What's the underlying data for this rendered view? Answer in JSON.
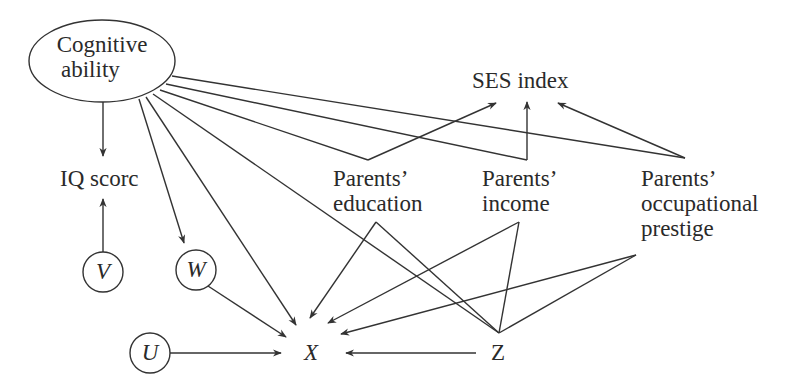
{
  "diagram": {
    "type": "causal-dag",
    "stroke_color": "#333333",
    "text_color": "#2a2a2a",
    "nodes": {
      "cognitive_ability": {
        "line1": "Cognitive",
        "line2": "ability",
        "shape": "ellipse"
      },
      "iq_score": {
        "label": "IQ scorc"
      },
      "ses_index": {
        "label": "SES index"
      },
      "parents_education": {
        "line1": "Parents’",
        "line2": "education"
      },
      "parents_income": {
        "line1": "Parents’",
        "line2": "income"
      },
      "parents_occupational_prestige": {
        "line1": "Parents’",
        "line2": "occupational",
        "line3": "prestige"
      },
      "v": {
        "label": "V",
        "shape": "circle"
      },
      "w": {
        "label": "W",
        "shape": "circle"
      },
      "u": {
        "label": "U",
        "shape": "circle"
      },
      "x": {
        "label": "X"
      },
      "z": {
        "label": "Z"
      }
    },
    "edges": [
      {
        "from": "Cognitive ability",
        "to": "IQ scorc"
      },
      {
        "from": "Cognitive ability",
        "to": "Parents’ education"
      },
      {
        "from": "Cognitive ability",
        "to": "Parents’ income"
      },
      {
        "from": "Cognitive ability",
        "to": "Parents’ occupational prestige"
      },
      {
        "from": "Cognitive ability",
        "to": "W"
      },
      {
        "from": "Cognitive ability",
        "to": "X"
      },
      {
        "from": "Cognitive ability",
        "to": "Z"
      },
      {
        "from": "Parents’ education",
        "to": "SES index"
      },
      {
        "from": "Parents’ income",
        "to": "SES index"
      },
      {
        "from": "Parents’ occupational prestige",
        "to": "SES index"
      },
      {
        "from": "Parents’ education",
        "to": "X"
      },
      {
        "from": "Parents’ income",
        "to": "X"
      },
      {
        "from": "Parents’ occupational prestige",
        "to": "X"
      },
      {
        "from": "Parents’ education",
        "to": "Z"
      },
      {
        "from": "Parents’ income",
        "to": "Z"
      },
      {
        "from": "Parents’ occupational prestige",
        "to": "Z"
      },
      {
        "from": "V",
        "to": "IQ scorc"
      },
      {
        "from": "W",
        "to": "X"
      },
      {
        "from": "U",
        "to": "X"
      },
      {
        "from": "Z",
        "to": "X"
      }
    ]
  }
}
